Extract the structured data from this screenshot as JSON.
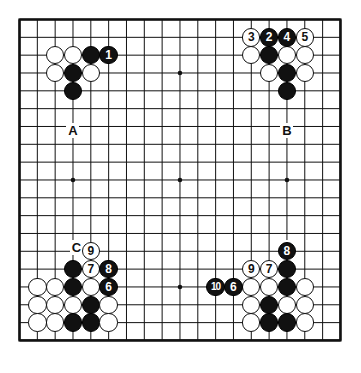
{
  "diagram": {
    "type": "go-board-diagram",
    "board_size": 19,
    "origin_x": 19.5,
    "origin_y": 19.5,
    "spacing": 17.83,
    "stone_radius": 9.2,
    "colors": {
      "line": "#111111",
      "black_stone": "#111111",
      "white_stone": "#ffffff",
      "background": "#ffffff",
      "label": "#111111"
    },
    "star_points": [
      {
        "col": 3,
        "row": 3
      },
      {
        "col": 9,
        "row": 3
      },
      {
        "col": 15,
        "row": 3
      },
      {
        "col": 3,
        "row": 9
      },
      {
        "col": 9,
        "row": 9
      },
      {
        "col": 15,
        "row": 9
      },
      {
        "col": 3,
        "row": 15
      },
      {
        "col": 9,
        "row": 15
      },
      {
        "col": 15,
        "row": 15
      }
    ],
    "stones": [
      {
        "col": 2,
        "row": 2,
        "color": "white",
        "label": ""
      },
      {
        "col": 3,
        "row": 2,
        "color": "white",
        "label": ""
      },
      {
        "col": 4,
        "row": 2,
        "color": "black",
        "label": ""
      },
      {
        "col": 5,
        "row": 2,
        "color": "black",
        "label": "1"
      },
      {
        "col": 2,
        "row": 3,
        "color": "white",
        "label": ""
      },
      {
        "col": 3,
        "row": 3,
        "color": "black",
        "label": ""
      },
      {
        "col": 4,
        "row": 3,
        "color": "white",
        "label": ""
      },
      {
        "col": 3,
        "row": 4,
        "color": "black",
        "label": ""
      },
      {
        "col": 13,
        "row": 1,
        "color": "white",
        "label": "3"
      },
      {
        "col": 14,
        "row": 1,
        "color": "black",
        "label": "2"
      },
      {
        "col": 15,
        "row": 1,
        "color": "black",
        "label": "4"
      },
      {
        "col": 16,
        "row": 1,
        "color": "white",
        "label": "5"
      },
      {
        "col": 13,
        "row": 2,
        "color": "white",
        "label": ""
      },
      {
        "col": 14,
        "row": 2,
        "color": "black",
        "label": ""
      },
      {
        "col": 15,
        "row": 2,
        "color": "white",
        "label": ""
      },
      {
        "col": 16,
        "row": 2,
        "color": "white",
        "label": ""
      },
      {
        "col": 14,
        "row": 3,
        "color": "white",
        "label": ""
      },
      {
        "col": 15,
        "row": 3,
        "color": "black",
        "label": ""
      },
      {
        "col": 16,
        "row": 3,
        "color": "white",
        "label": ""
      },
      {
        "col": 15,
        "row": 4,
        "color": "black",
        "label": ""
      },
      {
        "col": 4,
        "row": 13,
        "color": "white",
        "label": "9"
      },
      {
        "col": 3,
        "row": 14,
        "color": "black",
        "label": ""
      },
      {
        "col": 4,
        "row": 14,
        "color": "white",
        "label": "7"
      },
      {
        "col": 5,
        "row": 14,
        "color": "black",
        "label": "8"
      },
      {
        "col": 1,
        "row": 15,
        "color": "white",
        "label": ""
      },
      {
        "col": 2,
        "row": 15,
        "color": "white",
        "label": ""
      },
      {
        "col": 3,
        "row": 15,
        "color": "black",
        "label": ""
      },
      {
        "col": 4,
        "row": 15,
        "color": "white",
        "label": ""
      },
      {
        "col": 5,
        "row": 15,
        "color": "black",
        "label": "6"
      },
      {
        "col": 1,
        "row": 16,
        "color": "white",
        "label": ""
      },
      {
        "col": 2,
        "row": 16,
        "color": "white",
        "label": ""
      },
      {
        "col": 3,
        "row": 16,
        "color": "white",
        "label": ""
      },
      {
        "col": 4,
        "row": 16,
        "color": "black",
        "label": ""
      },
      {
        "col": 5,
        "row": 16,
        "color": "white",
        "label": ""
      },
      {
        "col": 1,
        "row": 17,
        "color": "white",
        "label": ""
      },
      {
        "col": 2,
        "row": 17,
        "color": "white",
        "label": ""
      },
      {
        "col": 3,
        "row": 17,
        "color": "black",
        "label": ""
      },
      {
        "col": 4,
        "row": 17,
        "color": "black",
        "label": ""
      },
      {
        "col": 5,
        "row": 17,
        "color": "white",
        "label": ""
      },
      {
        "col": 15,
        "row": 13,
        "color": "black",
        "label": "8"
      },
      {
        "col": 13,
        "row": 14,
        "color": "white",
        "label": "9"
      },
      {
        "col": 14,
        "row": 14,
        "color": "white",
        "label": "7"
      },
      {
        "col": 15,
        "row": 14,
        "color": "black",
        "label": ""
      },
      {
        "col": 11,
        "row": 15,
        "color": "black",
        "label": "10"
      },
      {
        "col": 12,
        "row": 15,
        "color": "black",
        "label": "6"
      },
      {
        "col": 13,
        "row": 15,
        "color": "white",
        "label": ""
      },
      {
        "col": 14,
        "row": 15,
        "color": "white",
        "label": ""
      },
      {
        "col": 15,
        "row": 15,
        "color": "black",
        "label": ""
      },
      {
        "col": 16,
        "row": 15,
        "color": "white",
        "label": ""
      },
      {
        "col": 13,
        "row": 16,
        "color": "white",
        "label": ""
      },
      {
        "col": 14,
        "row": 16,
        "color": "black",
        "label": ""
      },
      {
        "col": 15,
        "row": 16,
        "color": "white",
        "label": ""
      },
      {
        "col": 16,
        "row": 16,
        "color": "white",
        "label": ""
      },
      {
        "col": 13,
        "row": 17,
        "color": "white",
        "label": ""
      },
      {
        "col": 14,
        "row": 17,
        "color": "black",
        "label": ""
      },
      {
        "col": 15,
        "row": 17,
        "color": "black",
        "label": ""
      },
      {
        "col": 16,
        "row": 17,
        "color": "white",
        "label": ""
      }
    ],
    "markers": [
      {
        "text": "A",
        "col": 3,
        "row": 6.2
      },
      {
        "text": "B",
        "col": 15,
        "row": 6.2
      },
      {
        "text": "C",
        "col": 3.2,
        "row": 12.8
      },
      {
        "text": "D",
        "col": 15,
        "row": 12.8
      }
    ]
  }
}
